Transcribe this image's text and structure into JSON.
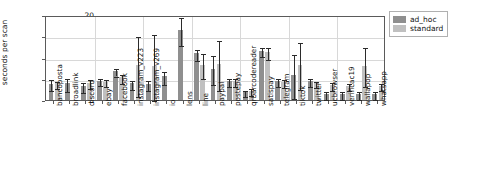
{
  "chart_data": {
    "type": "bar",
    "title": "",
    "xlabel": "",
    "ylabel": "seconds per scan",
    "ylim": [
      0,
      20
    ],
    "yticks": [
      0,
      5,
      10,
      15,
      20
    ],
    "grid": true,
    "legend_position": "upper right",
    "colors": {
      "ad_hoc": "#8f8f8f",
      "standard": "#c0c0c0",
      "error_bar": "#2b2b2b"
    },
    "categories": [
      "bancoposta",
      "broadlink",
      "discord",
      "ebay",
      "facebook",
      "instagram_v223",
      "instagram_v269",
      "io",
      "lens",
      "line",
      "paypal",
      "postepay",
      "qrbarcodereader",
      "satispay",
      "telegram",
      "tiktok",
      "twitter",
      "ucbrowser",
      "verificac19",
      "wallapop",
      "whatsapp"
    ],
    "series": [
      {
        "name": "ad_hoc",
        "values": [
          3.8,
          3.9,
          3.3,
          4.5,
          6.9,
          3.9,
          3.8,
          5.6,
          16.5,
          11.0,
          7.4,
          4.5,
          1.9,
          11.6,
          4.5,
          5.8,
          4.4,
          1.4,
          1.4,
          1.4,
          1.4
        ],
        "errors": [
          1.3,
          1.5,
          1.1,
          0.8,
          0.9,
          1.0,
          1.1,
          1.5,
          3.3,
          1.3,
          3.5,
          0.9,
          0.8,
          1.1,
          0.9,
          5.2,
          0.9,
          0.9,
          0.9,
          0.9,
          0.9
        ]
      },
      {
        "name": "standard",
        "values": [
          3.9,
          0.0,
          4.1,
          4.3,
          5.3,
          8.2,
          8.0,
          0.0,
          0.0,
          8.3,
          8.5,
          4.5,
          2.2,
          11.3,
          4.3,
          8.3,
          4.0,
          3.5,
          3.4,
          8.1,
          3.4
        ],
        "errors": [
          0.9,
          0.0,
          1.1,
          0.8,
          1.0,
          7.0,
          7.8,
          0.0,
          0.0,
          3.0,
          5.8,
          0.9,
          0.9,
          1.4,
          0.9,
          5.5,
          0.8,
          0.9,
          0.9,
          4.6,
          0.9
        ]
      }
    ],
    "legend": [
      {
        "label": "ad_hoc",
        "color": "#8f8f8f"
      },
      {
        "label": "standard",
        "color": "#c0c0c0"
      }
    ]
  }
}
